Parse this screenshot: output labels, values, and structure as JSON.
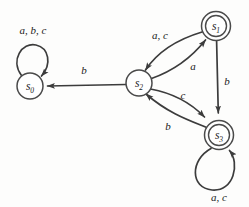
{
  "diagram": {
    "kind": "finite-state-automaton",
    "title": "",
    "colors": {
      "background": "#fdfdfc",
      "stroke": "#3c3c3c",
      "node_stroke": "#4a4a4a",
      "node_fill": "#ffffff",
      "text": "#1a1a1a"
    },
    "alphabet": [
      "a",
      "b",
      "c"
    ],
    "states": [
      {
        "id": "s0",
        "name": "s",
        "subscript": "0",
        "label": "s0",
        "accepting": false,
        "cx": 30,
        "cy": 86,
        "r": 13
      },
      {
        "id": "s1",
        "name": "s",
        "subscript": "1",
        "label": "s1",
        "accepting": true,
        "cx": 216,
        "cy": 26,
        "r": 14.5,
        "r_inner": 10.5
      },
      {
        "id": "s2",
        "name": "s",
        "subscript": "2",
        "label": "s2",
        "accepting": false,
        "cx": 139,
        "cy": 83,
        "r": 13
      },
      {
        "id": "s3",
        "name": "s",
        "subscript": "3",
        "label": "s3",
        "accepting": true,
        "cx": 219,
        "cy": 135,
        "r": 14.5,
        "r_inner": 10.5
      }
    ],
    "transitions": [
      {
        "id": "s0-self",
        "from": "s0",
        "to": "s0",
        "label": "a, b, c",
        "shape": "self-loop-top",
        "label_x": 33,
        "label_y": 34
      },
      {
        "id": "s2-to-s0",
        "from": "s2",
        "to": "s0",
        "label": "b",
        "shape": "straight",
        "label_x": 84,
        "label_y": 74
      },
      {
        "id": "s1-to-s2",
        "from": "s1",
        "to": "s2",
        "label": "a, c",
        "shape": "curve-upper",
        "label_x": 160,
        "label_y": 39
      },
      {
        "id": "s2-to-s1",
        "from": "s2",
        "to": "s1",
        "label": "a",
        "shape": "curve-lower",
        "label_x": 193,
        "label_y": 70
      },
      {
        "id": "s1-to-s3",
        "from": "s1",
        "to": "s3",
        "label": "b",
        "shape": "straight-vertical",
        "label_x": 227,
        "label_y": 85
      },
      {
        "id": "s2-to-s3",
        "from": "s2",
        "to": "s3",
        "label": "c",
        "shape": "curve-upper",
        "label_x": 183,
        "label_y": 99
      },
      {
        "id": "s3-to-s2",
        "from": "s3",
        "to": "s2",
        "label": "b",
        "shape": "curve-lower",
        "label_x": 168,
        "label_y": 130
      },
      {
        "id": "s3-self",
        "from": "s3",
        "to": "s3",
        "label": "a, c",
        "shape": "self-loop-bottom",
        "label_x": 219,
        "label_y": 201
      }
    ]
  }
}
